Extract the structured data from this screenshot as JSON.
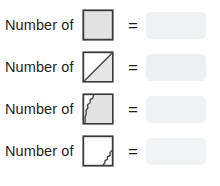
{
  "worksheet": {
    "rows": [
      {
        "label": "Number of",
        "shape_name": "solid-shaded-square",
        "equals": "=",
        "answer_value": "",
        "answer_placeholder": ""
      },
      {
        "label": "Number of",
        "shape_name": "square-with-diagonal-half-shaded",
        "equals": "=",
        "answer_value": "",
        "answer_placeholder": ""
      },
      {
        "label": "Number of",
        "shape_name": "square-with-jagged-left-edge-mostly-shaded",
        "equals": "=",
        "answer_value": "",
        "answer_placeholder": ""
      },
      {
        "label": "Number of",
        "shape_name": "square-with-jagged-right-edge-unshaded",
        "equals": "=",
        "answer_value": "",
        "answer_placeholder": ""
      }
    ]
  },
  "colors": {
    "text": "#231f20",
    "shape_outline": "#3a3a3a",
    "shape_fill": "#e2e2e2",
    "shape_empty": "#ffffff",
    "answer_box": "#f0f1f2",
    "page_background": "#ffffff"
  }
}
